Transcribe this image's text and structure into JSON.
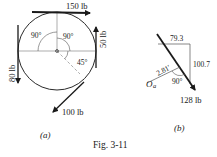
{
  "figure": {
    "caption": "Fig. 3-11",
    "panel_a": {
      "label": "(a)",
      "forces": {
        "top": "150 lb",
        "right": "50 lb",
        "left": "80 lb",
        "diagonal": "100 lb"
      },
      "angles": {
        "upper_left": "90°",
        "upper_right": "90°",
        "lower_right": "45°"
      }
    },
    "panel_b": {
      "label": "(b)",
      "horizontal_component": "79.3",
      "vertical_component": "100.7",
      "resultant": "128 lb",
      "distance": "2.81′",
      "angle": "90°",
      "point": "O",
      "angle_symbol": "a"
    }
  }
}
